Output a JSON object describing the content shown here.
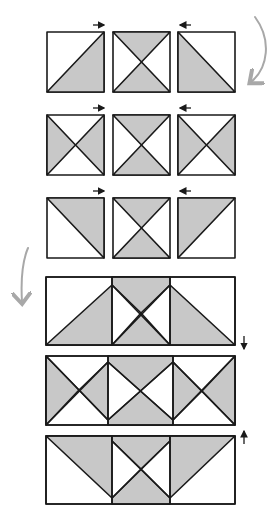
{
  "diagram": {
    "colors": {
      "fill": "#c8c8c8",
      "background": "#ffffff",
      "stroke": "#1a1a1a",
      "curved_arrow": "#a8a8a8"
    },
    "units": [
      {
        "row": 1,
        "position": "left",
        "type": "half-square-triangle",
        "shaded": "bottom-right",
        "press_arrow": "right"
      },
      {
        "row": 1,
        "position": "center",
        "type": "hourglass",
        "shaded": "top-bottom"
      },
      {
        "row": 1,
        "position": "right",
        "type": "half-square-triangle",
        "shaded": "bottom-left",
        "press_arrow": "left"
      },
      {
        "row": 2,
        "position": "left",
        "type": "hourglass",
        "shaded": "left-right",
        "press_arrow": "right"
      },
      {
        "row": 2,
        "position": "center",
        "type": "hourglass",
        "shaded": "top-bottom"
      },
      {
        "row": 2,
        "position": "right",
        "type": "hourglass",
        "shaded": "left-right",
        "press_arrow": "left"
      },
      {
        "row": 3,
        "position": "left",
        "type": "half-square-triangle",
        "shaded": "top-right",
        "press_arrow": "right"
      },
      {
        "row": 3,
        "position": "center",
        "type": "hourglass",
        "shaded": "top-bottom"
      },
      {
        "row": 3,
        "position": "right",
        "type": "half-square-triangle",
        "shaded": "top-left",
        "press_arrow": "left"
      }
    ],
    "joined_rows": [
      {
        "row": 1,
        "press_arrow": "down"
      },
      {
        "row": 2,
        "press_arrow": "none"
      },
      {
        "row": 3,
        "press_arrow": "up"
      }
    ],
    "arrows": {
      "right": "→",
      "left": "←",
      "down": "↓",
      "up": "↑"
    }
  }
}
